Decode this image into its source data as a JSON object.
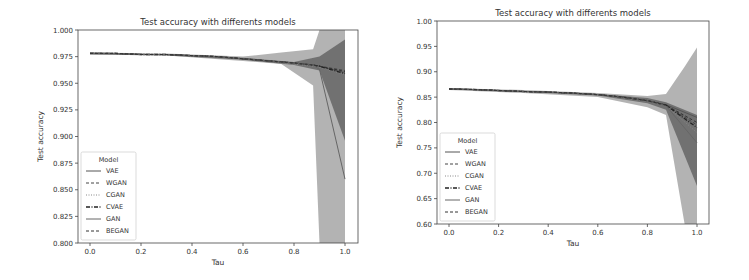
{
  "chart_data": [
    {
      "type": "line",
      "title": "Test accuracy with differents models",
      "xlabel": "Tau",
      "ylabel": "Test accuracy",
      "xlim": [
        -0.05,
        1.05
      ],
      "ylim": [
        0.8,
        1.0
      ],
      "xticks": [
        "0.0",
        "0.2",
        "0.4",
        "0.6",
        "0.8",
        "1.0"
      ],
      "yticks": [
        "0.800",
        "0.825",
        "0.850",
        "0.875",
        "0.900",
        "0.925",
        "0.950",
        "0.975",
        "1.000"
      ],
      "legend": {
        "title": "Model",
        "position": "lower left",
        "entries": [
          "VAE",
          "WGAN",
          "CGAN",
          "CVAE",
          "GAN",
          "BEGAN"
        ]
      },
      "x": [
        0.0,
        0.1,
        0.2,
        0.3,
        0.4,
        0.5,
        0.6,
        0.7,
        0.8,
        0.875,
        0.9,
        1.0
      ],
      "series": [
        {
          "name": "VAE",
          "values": [
            0.978,
            0.978,
            0.977,
            0.977,
            0.976,
            0.975,
            0.973,
            0.971,
            0.969,
            0.967,
            0.966,
            0.96
          ]
        },
        {
          "name": "WGAN",
          "values": [
            0.978,
            0.978,
            0.977,
            0.977,
            0.976,
            0.975,
            0.973,
            0.971,
            0.969,
            0.967,
            0.966,
            0.962
          ]
        },
        {
          "name": "CGAN",
          "values": [
            0.978,
            0.978,
            0.977,
            0.977,
            0.976,
            0.975,
            0.973,
            0.971,
            0.968,
            0.966,
            0.965,
            0.958
          ]
        },
        {
          "name": "CVAE",
          "values": [
            0.978,
            0.978,
            0.977,
            0.977,
            0.976,
            0.975,
            0.973,
            0.971,
            0.969,
            0.967,
            0.966,
            0.959
          ]
        },
        {
          "name": "GAN",
          "values": [
            0.978,
            0.978,
            0.977,
            0.977,
            0.976,
            0.975,
            0.973,
            0.971,
            0.969,
            0.967,
            0.963,
            0.86
          ]
        },
        {
          "name": "BEGAN",
          "values": [
            0.978,
            0.978,
            0.977,
            0.977,
            0.976,
            0.975,
            0.973,
            0.971,
            0.969,
            0.967,
            0.966,
            0.961
          ]
        }
      ],
      "bands": [
        {
          "x": [
            0.0,
            0.3,
            0.6,
            0.75,
            0.875,
            0.9,
            1.0
          ],
          "upper": [
            0.979,
            0.978,
            0.975,
            0.979,
            0.982,
            1.0,
            1.0
          ],
          "lower": [
            0.977,
            0.976,
            0.971,
            0.968,
            0.948,
            0.8,
            0.8
          ],
          "color": "#9a9a9a",
          "opacity": 0.75
        },
        {
          "x": [
            0.0,
            0.3,
            0.6,
            0.8,
            0.9,
            1.0
          ],
          "upper": [
            0.979,
            0.977,
            0.974,
            0.97,
            0.975,
            0.991
          ],
          "lower": [
            0.977,
            0.976,
            0.972,
            0.967,
            0.962,
            0.896
          ],
          "color": "#555555",
          "opacity": 0.7
        }
      ]
    },
    {
      "type": "line",
      "title": "Test accuracy with differents models",
      "xlabel": "Tau",
      "ylabel": "Test accuracy",
      "xlim": [
        -0.05,
        1.05
      ],
      "ylim": [
        0.6,
        1.0
      ],
      "xticks": [
        "0.0",
        "0.2",
        "0.4",
        "0.6",
        "0.8",
        "1.0"
      ],
      "yticks": [
        "0.60",
        "0.65",
        "0.70",
        "0.75",
        "0.80",
        "0.85",
        "0.90",
        "0.95",
        "1.00"
      ],
      "legend": {
        "title": "Model",
        "position": "lower left",
        "entries": [
          "VAE",
          "WGAN",
          "CGAN",
          "CVAE",
          "GAN",
          "BEGAN"
        ]
      },
      "x": [
        0.0,
        0.1,
        0.2,
        0.3,
        0.4,
        0.5,
        0.6,
        0.7,
        0.8,
        0.875,
        1.0
      ],
      "series": [
        {
          "name": "VAE",
          "values": [
            0.866,
            0.865,
            0.863,
            0.861,
            0.86,
            0.858,
            0.855,
            0.85,
            0.843,
            0.835,
            0.81
          ]
        },
        {
          "name": "WGAN",
          "values": [
            0.866,
            0.865,
            0.863,
            0.861,
            0.86,
            0.858,
            0.855,
            0.85,
            0.843,
            0.834,
            0.795
          ]
        },
        {
          "name": "CGAN",
          "values": [
            0.866,
            0.865,
            0.863,
            0.861,
            0.86,
            0.858,
            0.855,
            0.849,
            0.842,
            0.833,
            0.78
          ]
        },
        {
          "name": "CVAE",
          "values": [
            0.866,
            0.865,
            0.863,
            0.861,
            0.86,
            0.858,
            0.855,
            0.85,
            0.843,
            0.834,
            0.79
          ]
        },
        {
          "name": "GAN",
          "values": [
            0.866,
            0.865,
            0.863,
            0.861,
            0.86,
            0.858,
            0.855,
            0.85,
            0.843,
            0.833,
            0.76
          ]
        },
        {
          "name": "BEGAN",
          "values": [
            0.866,
            0.865,
            0.863,
            0.861,
            0.86,
            0.858,
            0.855,
            0.85,
            0.843,
            0.834,
            0.8
          ]
        }
      ],
      "bands": [
        {
          "x": [
            0.0,
            0.3,
            0.6,
            0.8,
            0.875,
            0.95,
            1.0
          ],
          "upper": [
            0.868,
            0.864,
            0.858,
            0.852,
            0.856,
            0.91,
            0.948
          ],
          "lower": [
            0.864,
            0.858,
            0.85,
            0.83,
            0.815,
            0.6,
            0.6
          ],
          "color": "#9a9a9a",
          "opacity": 0.75
        },
        {
          "x": [
            0.0,
            0.3,
            0.6,
            0.8,
            0.875,
            1.0
          ],
          "upper": [
            0.867,
            0.862,
            0.856,
            0.848,
            0.84,
            0.815
          ],
          "lower": [
            0.865,
            0.86,
            0.853,
            0.838,
            0.825,
            0.675
          ],
          "color": "#555555",
          "opacity": 0.7
        }
      ]
    }
  ],
  "charts_layout": [
    {
      "x0": 90,
      "x1": 345,
      "y0": 243,
      "y1": 30,
      "left": 78,
      "right": 358,
      "top": 30,
      "bottom": 243
    },
    {
      "x0": 449,
      "x1": 697,
      "y0": 224,
      "y1": 21,
      "left": 437,
      "right": 709,
      "top": 21,
      "bottom": 224
    }
  ],
  "line_styles": {
    "VAE": {
      "dash": "",
      "width": 1.0,
      "color": "#555555"
    },
    "WGAN": {
      "dash": "3,2",
      "width": 1.0,
      "color": "#444444"
    },
    "CGAN": {
      "dash": "1,1.5",
      "width": 1.0,
      "color": "#888888"
    },
    "CVAE": {
      "dash": "4,1.5,1,1.5",
      "width": 1.3,
      "color": "#222222"
    },
    "GAN": {
      "dash": "",
      "width": 1.0,
      "color": "#666666"
    },
    "BEGAN": {
      "dash": "3,2",
      "width": 1.0,
      "color": "#333333"
    }
  }
}
